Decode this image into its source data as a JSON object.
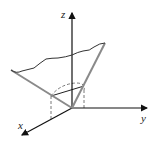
{
  "diagram": {
    "type": "3d-coordinate-sketch",
    "axes": {
      "z": {
        "label": "z"
      },
      "y": {
        "label": "y"
      },
      "x": {
        "label": "x"
      }
    },
    "colors": {
      "axis": "#111111",
      "cone_edge": "#8a8a8a",
      "curve": "#333333",
      "dashed": "#555555",
      "background": "#ffffff"
    }
  }
}
